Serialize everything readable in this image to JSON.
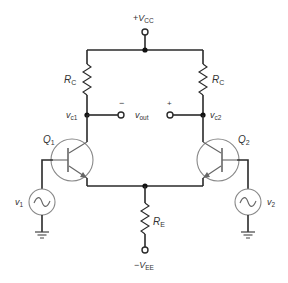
{
  "diagram": {
    "supplies": {
      "vcc": {
        "sign": "+",
        "main": "V",
        "sub": "CC"
      },
      "vee": {
        "sign": "−",
        "main": "V",
        "sub": "EE"
      }
    },
    "resistors": {
      "rc_left": {
        "main": "R",
        "sub": "C"
      },
      "rc_right": {
        "main": "R",
        "sub": "C"
      },
      "re": {
        "main": "R",
        "sub": "E"
      }
    },
    "nodes": {
      "vc1": {
        "main": "v",
        "sub": "c1"
      },
      "vc2": {
        "main": "v",
        "sub": "c2"
      }
    },
    "output": {
      "main": "v",
      "sub": "out",
      "minus": "−",
      "plus": "+"
    },
    "transistors": {
      "q1": {
        "main": "Q",
        "sub": "1"
      },
      "q2": {
        "main": "Q",
        "sub": "2"
      }
    },
    "sources": {
      "v1": {
        "main": "v",
        "sub": "1"
      },
      "v2": {
        "main": "v",
        "sub": "2"
      }
    },
    "colors": {
      "wire": "#2a2a2a",
      "component_outline": "#888888",
      "text": "#333333"
    }
  }
}
